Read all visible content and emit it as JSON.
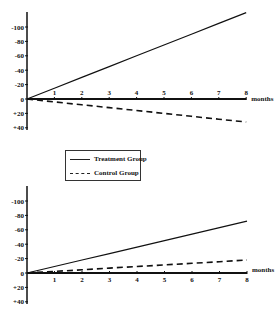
{
  "chart_data": [
    {
      "type": "line",
      "title": "",
      "xlabel": "months",
      "ylabel": "",
      "x": [
        0,
        1,
        2,
        3,
        4,
        5,
        6,
        7,
        8
      ],
      "x_ticks": [
        "1",
        "2",
        "3",
        "4",
        "5",
        "6",
        "7",
        "8"
      ],
      "y_ticks": [
        "-100",
        "-80",
        "-60",
        "-40",
        "-20",
        "0",
        "+20",
        "+40"
      ],
      "ylim": [
        -120,
        40
      ],
      "y_inverted_sign_labels": true,
      "series": [
        {
          "name": "Treatment Group",
          "style": "solid",
          "values": [
            0,
            -15,
            -30,
            -45,
            -60,
            -75,
            -90,
            -105,
            -120
          ]
        },
        {
          "name": "Control Group",
          "style": "dashed",
          "values": [
            0,
            4,
            8,
            12,
            16,
            20,
            24,
            28,
            32
          ]
        }
      ],
      "grid": false
    },
    {
      "type": "line",
      "title": "",
      "xlabel": "months",
      "ylabel": "",
      "x": [
        0,
        1,
        2,
        3,
        4,
        5,
        6,
        7,
        8
      ],
      "x_ticks": [
        "1",
        "2",
        "3",
        "4",
        "5",
        "6",
        "7",
        "8"
      ],
      "y_ticks": [
        "-100",
        "-80",
        "-60",
        "-40",
        "-20",
        "0",
        "+20",
        "+40"
      ],
      "ylim": [
        -120,
        40
      ],
      "y_inverted_sign_labels": true,
      "series": [
        {
          "name": "Treatment Group",
          "style": "solid",
          "values": [
            0,
            -9,
            -18,
            -27,
            -36,
            -45,
            -54,
            -63,
            -72
          ]
        },
        {
          "name": "Control Group",
          "style": "dashed",
          "values": [
            0,
            -2.25,
            -4.5,
            -6.75,
            -9,
            -11.25,
            -13.5,
            -15.75,
            -18
          ]
        }
      ],
      "grid": false
    }
  ],
  "legend": {
    "items": [
      {
        "label": "Treatment Group",
        "style": "solid"
      },
      {
        "label": "Control Group",
        "style": "dashed"
      }
    ]
  },
  "axis": {
    "x_label": "months",
    "x_ticks": [
      "1",
      "2",
      "3",
      "4",
      "5",
      "6",
      "7",
      "8"
    ],
    "y_ticks": [
      "-100",
      "-80",
      "-60",
      "-40",
      "-20",
      "0",
      "+20",
      "+40"
    ]
  },
  "colors": {
    "line": "#111111",
    "background": "#ffffff"
  }
}
